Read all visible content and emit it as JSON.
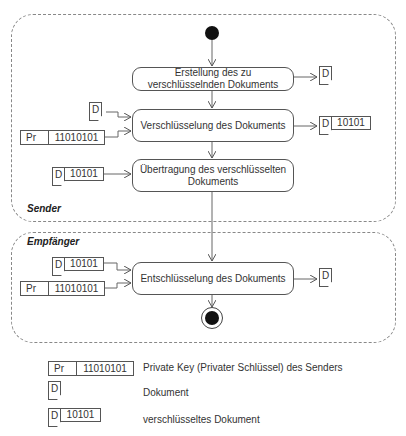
{
  "lanes": {
    "sender": "Sender",
    "receiver": "Empfänger"
  },
  "actions": [
    {
      "id": "create",
      "label": "Erstellung des zu verschlüsselnden Dokuments"
    },
    {
      "id": "encrypt",
      "label": "Verschlüsselung des Dokuments"
    },
    {
      "id": "transmit",
      "label": "Übertragung des verschlüsselten Dokuments"
    },
    {
      "id": "decrypt",
      "label": "Entschlüsselung des Dokuments"
    }
  ],
  "objects": {
    "doc_letter": "D",
    "encrypted_value": "10101",
    "key_prefix": "Pr",
    "key_value": "11010101"
  },
  "legend": [
    {
      "symbol": "private-key",
      "text": "Private Key (Privater Schlüssel) des Senders"
    },
    {
      "symbol": "document",
      "text": "Dokument"
    },
    {
      "symbol": "encrypted-document",
      "text": "verschlüsseltes Dokument"
    }
  ],
  "nodes": {
    "start": "initial-node",
    "end": "final-node"
  }
}
